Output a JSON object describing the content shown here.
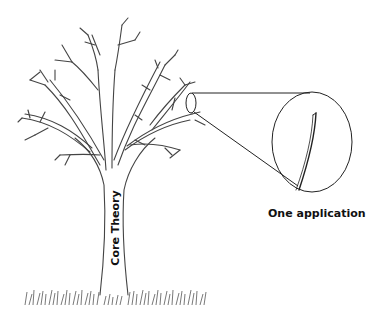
{
  "diagram": {
    "type": "illustration",
    "labels": {
      "trunk": "Core Theory",
      "magnified_branch": "One application"
    },
    "elements": [
      {
        "id": "tree",
        "description": "bare deciduous tree with branching limbs"
      },
      {
        "id": "grass",
        "description": "grass tufts at base of trunk"
      },
      {
        "id": "small-circle",
        "description": "small ellipse highlighting one twig on right side of tree"
      },
      {
        "id": "magnifier",
        "description": "large ellipse showing zoomed-in twig, connected by two lines"
      }
    ],
    "colors": {
      "stroke": "#333333",
      "background": "#ffffff",
      "grass": "#555555"
    }
  }
}
